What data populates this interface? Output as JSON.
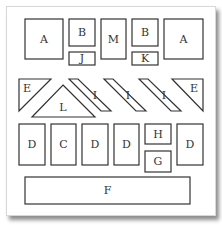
{
  "diagram": {
    "type": "floor-layout",
    "rows": [
      {
        "row": "top",
        "items": [
          {
            "id": "a-left",
            "label": "A",
            "shape": "square"
          },
          {
            "id": "b-left",
            "label": "B",
            "shape": "square"
          },
          {
            "id": "j",
            "label": "J",
            "shape": "rect"
          },
          {
            "id": "m",
            "label": "M",
            "shape": "tall-rect"
          },
          {
            "id": "b-right",
            "label": "B",
            "shape": "square"
          },
          {
            "id": "k",
            "label": "K",
            "shape": "rect"
          },
          {
            "id": "a-right",
            "label": "A",
            "shape": "square"
          }
        ]
      },
      {
        "row": "middle",
        "items": [
          {
            "id": "e-left",
            "label": "E",
            "shape": "triangle"
          },
          {
            "id": "l",
            "label": "L",
            "shape": "triangle"
          },
          {
            "id": "i-1",
            "label": "I",
            "shape": "parallelogram"
          },
          {
            "id": "i-2",
            "label": "I",
            "shape": "parallelogram"
          },
          {
            "id": "i-3",
            "label": "I",
            "shape": "parallelogram"
          },
          {
            "id": "e-right",
            "label": "E",
            "shape": "triangle"
          }
        ]
      },
      {
        "row": "lower",
        "items": [
          {
            "id": "d-1",
            "label": "D",
            "shape": "tall-rect"
          },
          {
            "id": "c",
            "label": "C",
            "shape": "tall-rect"
          },
          {
            "id": "d-2",
            "label": "D",
            "shape": "tall-rect"
          },
          {
            "id": "d-3",
            "label": "D",
            "shape": "tall-rect"
          },
          {
            "id": "h",
            "label": "H",
            "shape": "rect"
          },
          {
            "id": "g",
            "label": "G",
            "shape": "rect"
          },
          {
            "id": "d-4",
            "label": "D",
            "shape": "tall-rect"
          }
        ]
      },
      {
        "row": "bottom",
        "items": [
          {
            "id": "f",
            "label": "F",
            "shape": "wide-rect"
          }
        ]
      }
    ]
  },
  "labels": {
    "a_left": "A",
    "b_left": "B",
    "j": "J",
    "m": "M",
    "b_right": "B",
    "k": "K",
    "a_right": "A",
    "e_left": "E",
    "l": "L",
    "i_1": "I",
    "i_2": "I",
    "i_3": "I",
    "e_right": "E",
    "d_1": "D",
    "c": "C",
    "d_2": "D",
    "d_3": "D",
    "h": "H",
    "g": "G",
    "d_4": "D",
    "f": "F"
  }
}
